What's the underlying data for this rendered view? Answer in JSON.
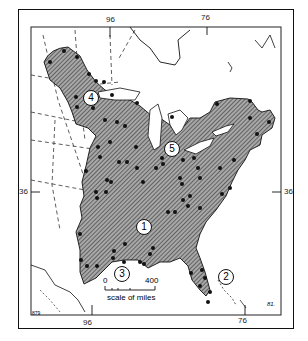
{
  "map": {
    "longitude_labels_top": [
      "96",
      "76"
    ],
    "longitude_labels_bottom": [
      "96",
      "76"
    ],
    "latitude_labels": [
      "36",
      "36"
    ],
    "regions": [
      {
        "id": "1",
        "x": 143,
        "y": 226
      },
      {
        "id": "2",
        "x": 225,
        "y": 276
      },
      {
        "id": "3",
        "x": 121,
        "y": 273
      },
      {
        "id": "4",
        "x": 90,
        "y": 97
      },
      {
        "id": "5",
        "x": 171,
        "y": 148
      }
    ],
    "scale": {
      "start": "0",
      "end": "400",
      "label": "scale of miles"
    },
    "signature": "81.",
    "credit": "879",
    "colors": {
      "fill": "#9a9a9a",
      "hatch": "#333333",
      "ink": "#111111",
      "background": "#ffffff"
    }
  }
}
